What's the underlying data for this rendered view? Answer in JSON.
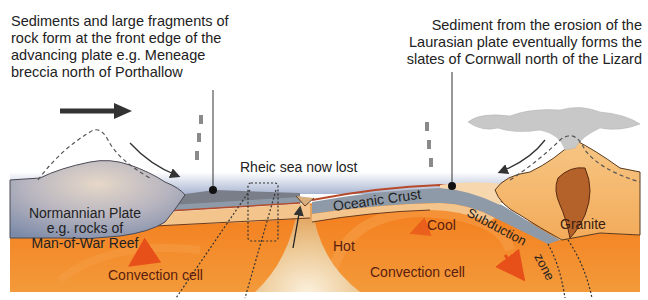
{
  "diagram": {
    "type": "geological cross-section"
  },
  "captions": {
    "left": [
      "Sediments and large fragments of",
      "rock form at the front edge of the",
      "advancing plate e.g. Meneage",
      "breccia north of Porthallow"
    ],
    "right": [
      "Sediment from the erosion of the",
      "Laurasian plate eventually forms the",
      "slates of Cornwall north of the Lizard"
    ]
  },
  "labels": {
    "sea": "Rheic sea now lost",
    "plate": [
      "Normannian Plate",
      "e.g. rocks of",
      "Man-of-War Reef"
    ],
    "oceanic_crust": "Oceanic Crust",
    "subduction": "Subduction",
    "zone": "zone",
    "cool": "Cool",
    "hot": "Hot",
    "convection_left": "Convection cell",
    "convection_right": "Convection cell",
    "granite": "Granite"
  },
  "colors": {
    "mantle": "#f07a1c",
    "mantle_light": "#f6a040",
    "plume": "#e8c48e",
    "normannian_plate": "#8e9bb4",
    "oceanic_crust": "#8e9aa6",
    "crust_tan": "#f3c58c",
    "laurasian_plate": "#f4b462",
    "granite": "#b4622a",
    "ash_cloud": "#c8c8c8",
    "sea": "#b8c4dc",
    "text_dark_red": "#5a1d0e",
    "arrow_red": "#e8501a"
  }
}
